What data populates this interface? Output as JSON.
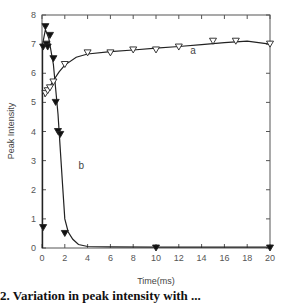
{
  "chart_data": {
    "type": "scatter",
    "title": "",
    "xlabel": "Time(ms)",
    "ylabel": "Peak Intensity",
    "xlim": [
      0,
      20
    ],
    "ylim": [
      0,
      8
    ],
    "xticks": [
      0,
      2,
      4,
      6,
      8,
      10,
      12,
      14,
      16,
      18,
      20
    ],
    "yticks": [
      0,
      1,
      2,
      3,
      4,
      5,
      6,
      7,
      8
    ],
    "grid": false,
    "legend": "none (curves labeled inline 'a' and 'b')",
    "series": [
      {
        "name": "a",
        "marker": "open-down-triangle",
        "label_position": {
          "x": 13,
          "y": 6.65
        },
        "x": [
          0.3,
          0.5,
          0.7,
          1.0,
          2.0,
          4.0,
          6.0,
          8.0,
          10.0,
          12.0,
          15.0,
          17.0,
          20.0
        ],
        "y": [
          5.3,
          5.4,
          5.5,
          5.7,
          6.3,
          6.7,
          6.7,
          6.8,
          6.8,
          6.9,
          7.1,
          7.1,
          7.0
        ],
        "fit_curve": {
          "x": [
            0.2,
            0.5,
            1.0,
            1.5,
            2.0,
            3.0,
            4.0,
            6.0,
            8.0,
            10.0,
            12.0,
            14.0,
            16.0,
            18.0,
            20.0
          ],
          "y": [
            5.2,
            5.42,
            5.75,
            6.05,
            6.28,
            6.55,
            6.66,
            6.74,
            6.8,
            6.86,
            6.92,
            6.98,
            7.05,
            7.1,
            7.0
          ]
        }
      },
      {
        "name": "b",
        "marker": "filled-down-triangle",
        "label_position": {
          "x": 3.2,
          "y": 2.7
        },
        "x": [
          0.1,
          0.1,
          0.3,
          0.4,
          0.5,
          0.7,
          1.0,
          1.2,
          1.4,
          1.6,
          2.0,
          10.0,
          20.0
        ],
        "y": [
          0.7,
          6.9,
          7.6,
          7.0,
          6.9,
          7.3,
          6.5,
          5.0,
          4.0,
          3.9,
          0.5,
          0.0,
          0.0
        ],
        "fit_curve": {
          "x": [
            0.05,
            0.05,
            0.3,
            0.6,
            1.0,
            1.4,
            1.8,
            2.0,
            2.3,
            2.7,
            3.2,
            4.0,
            6.0,
            10.0,
            20.0
          ],
          "y": [
            0.0,
            7.0,
            7.5,
            7.2,
            6.3,
            4.6,
            2.2,
            1.0,
            0.55,
            0.3,
            0.12,
            0.05,
            0.04,
            0.03,
            0.03
          ]
        }
      }
    ]
  },
  "caption": "2. Variation in peak intensity with ..."
}
